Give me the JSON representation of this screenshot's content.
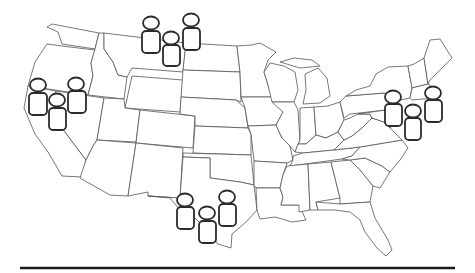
{
  "map": {
    "subject": "Contiguous United States outline map with state borders",
    "background_color": "#ffffff",
    "border_color": "#555555",
    "icon_color": "#2b2b2b",
    "baseline_color": "#1a1a1a"
  },
  "clusters": [
    {
      "region": "northern-rockies",
      "icon": "person-icon",
      "count": 3,
      "people": [
        {
          "head": [
            151,
            23
          ],
          "body": [
            142,
            31,
            18,
            22
          ]
        },
        {
          "head": [
            171,
            38
          ],
          "body": [
            163,
            45,
            17,
            21
          ]
        },
        {
          "head": [
            191,
            20
          ],
          "body": [
            183,
            28,
            17,
            22
          ]
        }
      ]
    },
    {
      "region": "west-coast",
      "icon": "person-icon",
      "count": 3,
      "people": [
        {
          "head": [
            38,
            85
          ],
          "body": [
            29,
            93,
            18,
            22
          ]
        },
        {
          "head": [
            57,
            100
          ],
          "body": [
            49,
            108,
            17,
            22
          ]
        },
        {
          "head": [
            76,
            84
          ],
          "body": [
            68,
            91,
            18,
            22
          ]
        }
      ]
    },
    {
      "region": "northeast",
      "icon": "person-icon",
      "count": 3,
      "people": [
        {
          "head": [
            393,
            97
          ],
          "body": [
            385,
            104,
            17,
            22
          ]
        },
        {
          "head": [
            413,
            111
          ],
          "body": [
            405,
            118,
            16,
            22
          ]
        },
        {
          "head": [
            433,
            93
          ],
          "body": [
            425,
            100,
            17,
            22
          ]
        }
      ]
    },
    {
      "region": "texas",
      "icon": "person-icon",
      "count": 3,
      "people": [
        {
          "head": [
            185,
            200
          ],
          "body": [
            177,
            207,
            17,
            22
          ]
        },
        {
          "head": [
            207,
            213
          ],
          "body": [
            199,
            221,
            17,
            22
          ]
        },
        {
          "head": [
            227,
            197
          ],
          "body": [
            219,
            204,
            17,
            22
          ]
        }
      ]
    }
  ],
  "baseline": {
    "x1": 20,
    "x2": 455,
    "y": 268
  }
}
